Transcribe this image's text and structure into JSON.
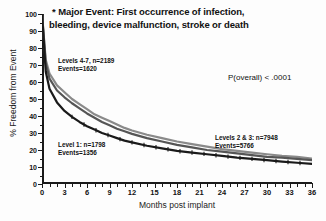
{
  "title": {
    "line1": "* Major Event: First occurrence of infection,",
    "line2": "bleeding, device malfunction, stroke or death"
  },
  "axes": {
    "y_title": "% Freedom from Event",
    "x_title": "Months post implant",
    "y_ticks": [
      "0",
      "10",
      "20",
      "30",
      "40",
      "50",
      "60",
      "70",
      "80",
      "90",
      "100"
    ],
    "x_ticks": [
      "0",
      "3",
      "6",
      "9",
      "12",
      "15",
      "18",
      "21",
      "24",
      "27",
      "30",
      "33",
      "36"
    ]
  },
  "annotations": {
    "levels47": {
      "line1": "Levels 4-7, n=2189",
      "line2": "Events=1620"
    },
    "level1": {
      "line1": "Level 1:  n=1798",
      "line2": "Events=1356"
    },
    "levels23": {
      "line1": "Levels 2 & 3: n=7948",
      "line2": "Events=5766"
    },
    "pvalue": "P(overall) < .0001"
  },
  "chart_data": {
    "type": "line",
    "title": "* Major Event: First occurrence of infection, bleeding, device malfunction, stroke or death",
    "xlabel": "Months post implant",
    "ylabel": "% Freedom from Event",
    "xlim": [
      0,
      36
    ],
    "ylim": [
      0,
      100
    ],
    "grid": false,
    "legend": "annotations-inline",
    "x": [
      0,
      0.5,
      1,
      2,
      3,
      4,
      5,
      6,
      7,
      8,
      9,
      10,
      11,
      12,
      14,
      16,
      18,
      20,
      22,
      24,
      26,
      28,
      30,
      32,
      34,
      36
    ],
    "series": [
      {
        "name": "Levels 4-7",
        "n": 2189,
        "events": 1620,
        "color": "#8a8a8a",
        "values": [
          100,
          73,
          65,
          58,
          54,
          50,
          47,
          44,
          41,
          39,
          37,
          35,
          33,
          31.5,
          29,
          27,
          25,
          23.5,
          22,
          20.5,
          19.5,
          18.5,
          17.5,
          16.5,
          16,
          15
        ]
      },
      {
        "name": "Levels 2 & 3",
        "n": 7948,
        "events": 5766,
        "color": "#555555",
        "values": [
          100,
          71,
          62,
          55,
          51,
          47.5,
          44.5,
          41.5,
          39,
          36.5,
          34.5,
          32.5,
          31,
          29.5,
          27,
          25,
          23,
          21.5,
          20,
          19,
          18,
          17,
          16,
          15.5,
          14.8,
          14
        ]
      },
      {
        "name": "Level 1",
        "n": 1798,
        "events": 1356,
        "color": "#1a1a1a",
        "values": [
          100,
          66,
          56,
          48,
          43,
          39.5,
          36.5,
          34,
          32,
          30,
          28.5,
          27,
          25.5,
          24.5,
          22.5,
          21,
          19.5,
          18.5,
          17.5,
          16.5,
          15.5,
          14.8,
          14,
          13.2,
          12.5,
          11.8
        ]
      }
    ],
    "statistics": {
      "p_overall": "< .0001"
    }
  }
}
